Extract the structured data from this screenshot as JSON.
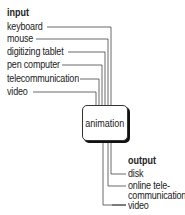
{
  "diagram": {
    "input": {
      "heading": "input",
      "items": [
        "keyboard",
        "mouse",
        "digitizing tablet",
        "pen computer",
        "telecommunication",
        "video"
      ]
    },
    "center": {
      "label": "animation"
    },
    "output": {
      "heading": "output",
      "items": [
        "disk",
        "online tele-",
        "communication",
        "video"
      ]
    }
  }
}
